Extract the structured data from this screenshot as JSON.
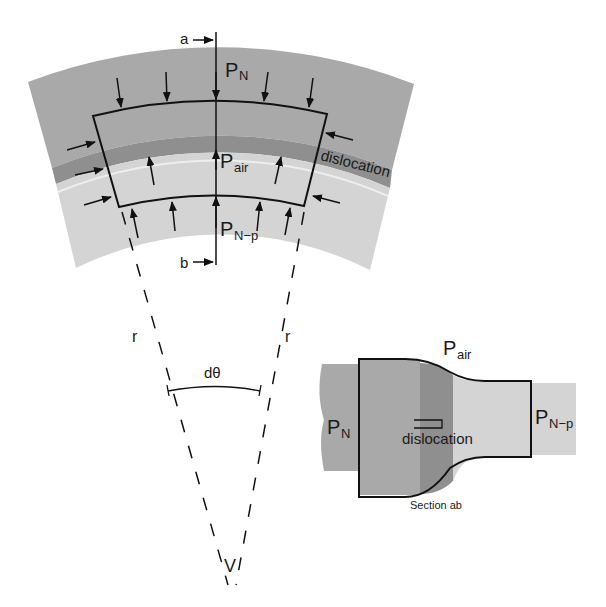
{
  "diagram": {
    "colors": {
      "outer_band": "#a9a9a9",
      "dislocation_band": "#8f8f8f",
      "inner_band": "#d4d4d4",
      "line": "#111111",
      "background": "#ffffff"
    },
    "arc_view": {
      "labels": {
        "section_top": "a",
        "section_bottom": "b",
        "pressure_outer_main": "P",
        "pressure_outer_sub": "N",
        "pressure_air_main": "P",
        "pressure_air_sub": "air",
        "pressure_inner_main": "P",
        "pressure_inner_sub": "N−p",
        "dislocation": "dislocation",
        "radius_left": "r",
        "radius_right": "r",
        "angle": "dθ",
        "vertex": "V"
      }
    },
    "section_view": {
      "labels": {
        "pressure_air_main": "P",
        "pressure_air_sub": "air",
        "pressure_left_main": "P",
        "pressure_left_sub": "N",
        "pressure_right_main": "P",
        "pressure_right_sub": "N−p",
        "dislocation": "dislocation",
        "caption": "Section ab"
      }
    }
  }
}
